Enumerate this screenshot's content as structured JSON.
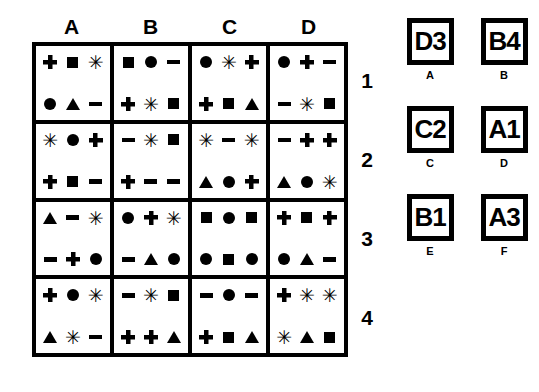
{
  "grid": {
    "column_headers": [
      "A",
      "B",
      "C",
      "D"
    ],
    "row_numbers": [
      "1",
      "2",
      "3",
      "4"
    ],
    "cells": [
      [
        {
          "top": [
            "plus",
            "square",
            "asterisk"
          ],
          "bottom": [
            "circle",
            "triangle",
            "minus"
          ]
        },
        {
          "top": [
            "square",
            "circle",
            "minus"
          ],
          "bottom": [
            "plus",
            "asterisk",
            "square"
          ]
        },
        {
          "top": [
            "circle",
            "asterisk",
            "plus"
          ],
          "bottom": [
            "plus",
            "square",
            "triangle"
          ]
        },
        {
          "top": [
            "circle",
            "plus",
            "minus"
          ],
          "bottom": [
            "minus",
            "asterisk",
            "square"
          ]
        }
      ],
      [
        {
          "top": [
            "asterisk",
            "circle",
            "plus"
          ],
          "bottom": [
            "plus",
            "square",
            "minus"
          ]
        },
        {
          "top": [
            "minus",
            "asterisk",
            "square"
          ],
          "bottom": [
            "plus",
            "minus",
            "minus"
          ]
        },
        {
          "top": [
            "asterisk",
            "minus",
            "asterisk"
          ],
          "bottom": [
            "triangle",
            "circle",
            "plus"
          ]
        },
        {
          "top": [
            "minus",
            "plus",
            "plus"
          ],
          "bottom": [
            "triangle",
            "circle",
            "asterisk"
          ]
        }
      ],
      [
        {
          "top": [
            "triangle",
            "minus",
            "asterisk"
          ],
          "bottom": [
            "minus",
            "plus",
            "circle"
          ]
        },
        {
          "top": [
            "circle",
            "plus",
            "asterisk"
          ],
          "bottom": [
            "minus",
            "triangle",
            "circle"
          ]
        },
        {
          "top": [
            "square",
            "circle",
            "square"
          ],
          "bottom": [
            "circle",
            "square",
            "circle"
          ]
        },
        {
          "top": [
            "plus",
            "square",
            "plus"
          ],
          "bottom": [
            "circle",
            "triangle",
            "minus"
          ]
        }
      ],
      [
        {
          "top": [
            "plus",
            "circle",
            "asterisk"
          ],
          "bottom": [
            "triangle",
            "asterisk",
            "minus"
          ]
        },
        {
          "top": [
            "minus",
            "asterisk",
            "square"
          ],
          "bottom": [
            "plus",
            "plus",
            "triangle"
          ]
        },
        {
          "top": [
            "minus",
            "circle",
            "minus"
          ],
          "bottom": [
            "plus",
            "square",
            "triangle"
          ]
        },
        {
          "top": [
            "plus",
            "asterisk",
            "asterisk"
          ],
          "bottom": [
            "asterisk",
            "triangle",
            "square"
          ]
        }
      ]
    ]
  },
  "answers": [
    {
      "label": "A",
      "value": "D3"
    },
    {
      "label": "B",
      "value": "B4"
    },
    {
      "label": "C",
      "value": "C2"
    },
    {
      "label": "D",
      "value": "A1"
    },
    {
      "label": "E",
      "value": "B1"
    },
    {
      "label": "F",
      "value": "A3"
    }
  ],
  "colors": {
    "ink": "#000000",
    "background": "#ffffff"
  }
}
